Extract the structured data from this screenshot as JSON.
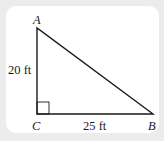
{
  "diagram": {
    "type": "right-triangle",
    "vertices": {
      "A": {
        "label": "A",
        "x": 37,
        "y": 28
      },
      "B": {
        "label": "B",
        "x": 153,
        "y": 114
      },
      "C": {
        "label": "C",
        "x": 37,
        "y": 114
      }
    },
    "sides": {
      "AC": {
        "label": "20 ft",
        "length": 20,
        "unit": "ft"
      },
      "CB": {
        "label": "25 ft",
        "length": 25,
        "unit": "ft"
      }
    },
    "right_angle_at": "C",
    "colors": {
      "background": "#ececec",
      "card": "#ffffff",
      "stroke": "#1a1a1a"
    }
  }
}
